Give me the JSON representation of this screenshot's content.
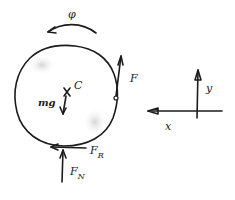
{
  "diagram": {
    "colors": {
      "ink": "#1c1c1c",
      "background": "#ffffff",
      "shade": "#d8d8d8"
    },
    "body": {
      "shape": "circle",
      "center_label": "C"
    },
    "rotation": {
      "label": "φ",
      "direction": "counter-clockwise"
    },
    "forces": [
      {
        "id": "F",
        "label": "F",
        "sub": "",
        "direction": "up",
        "applied_at": "right edge"
      },
      {
        "id": "mg",
        "label": "mg",
        "sub": "",
        "direction": "down",
        "applied_at": "C"
      },
      {
        "id": "FR",
        "label": "F",
        "sub": "R",
        "direction": "left",
        "applied_at": "contact point"
      },
      {
        "id": "FN",
        "label": "F",
        "sub": "N",
        "direction": "up",
        "applied_at": "contact point"
      }
    ],
    "axes": {
      "x_label": "x",
      "x_direction": "left",
      "y_label": "y",
      "y_direction": "up"
    }
  }
}
